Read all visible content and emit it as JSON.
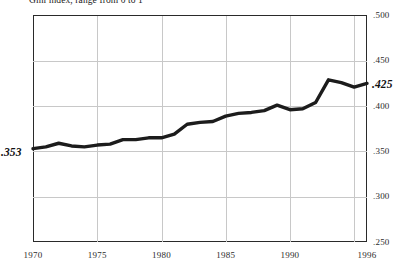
{
  "chart_data": {
    "type": "line",
    "title": "Gini index, range from 0 to 1",
    "xlabel": "",
    "ylabel": "",
    "xlim": [
      1970,
      1996
    ],
    "ylim": [
      0.25,
      0.5
    ],
    "grid": true,
    "legend": "none",
    "y_ticks": [
      ".500",
      ".450",
      ".400",
      ".350",
      ".300",
      ".250"
    ],
    "y_tick_values": [
      0.5,
      0.45,
      0.4,
      0.35,
      0.3,
      0.25
    ],
    "x_ticks": [
      "1970",
      "1975",
      "1980",
      "1985",
      "1990",
      "1996"
    ],
    "x_tick_values": [
      1970,
      1975,
      1980,
      1985,
      1990,
      1996
    ],
    "x_gridlines": [
      1975,
      1980,
      1985,
      1990,
      1995
    ],
    "series": [
      {
        "name": "Gini index",
        "color": "#1c1c1c",
        "x": [
          1970,
          1971,
          1972,
          1973,
          1974,
          1975,
          1976,
          1977,
          1978,
          1979,
          1980,
          1981,
          1982,
          1983,
          1984,
          1985,
          1986,
          1987,
          1988,
          1989,
          1990,
          1991,
          1992,
          1993,
          1994,
          1995,
          1996
        ],
        "values": [
          0.353,
          0.355,
          0.359,
          0.356,
          0.355,
          0.357,
          0.358,
          0.363,
          0.363,
          0.365,
          0.365,
          0.369,
          0.38,
          0.382,
          0.383,
          0.389,
          0.392,
          0.393,
          0.395,
          0.401,
          0.396,
          0.397,
          0.404,
          0.429,
          0.426,
          0.421,
          0.425
        ]
      }
    ],
    "annotations": [
      {
        "name": "start-value",
        "label": ".353",
        "x": 1970,
        "y": 0.353
      },
      {
        "name": "end-value",
        "label": ".425",
        "x": 1996,
        "y": 0.425
      }
    ]
  },
  "axis": {
    "y_labels": [
      {
        "text": ".500",
        "value": 0.5
      },
      {
        "text": ".450",
        "value": 0.45
      },
      {
        "text": ".400",
        "value": 0.4
      },
      {
        "text": ".350",
        "value": 0.35
      },
      {
        "text": ".300",
        "value": 0.3
      },
      {
        "text": ".250",
        "value": 0.25
      }
    ],
    "x_labels": [
      {
        "text": "1970",
        "value": 1970
      },
      {
        "text": "1975",
        "value": 1975
      },
      {
        "text": "1980",
        "value": 1980
      },
      {
        "text": "1985",
        "value": 1985
      },
      {
        "text": "1990",
        "value": 1990
      },
      {
        "text": "1996",
        "value": 1996
      }
    ]
  },
  "callouts": {
    "start": ".353",
    "end": ".425"
  },
  "colors": {
    "line": "#1c1c1c",
    "frame": "#2a2a2a",
    "grid": "#c8c8c8",
    "text": "#2b2b2b",
    "background": "#ffffff"
  }
}
